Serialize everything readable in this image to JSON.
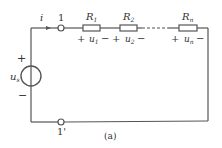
{
  "diagram": {
    "type": "series-resistor-circuit",
    "caption": "(a)",
    "current_label": "i",
    "terminals": [
      {
        "id": "1",
        "label": "1"
      },
      {
        "id": "1p",
        "label": "1'"
      }
    ],
    "source": {
      "symbol": "u",
      "subscript": "s",
      "plus": "+",
      "minus": "−"
    },
    "resistors": [
      {
        "name": "R",
        "sub": "1",
        "voltage": "u",
        "vsub": "1",
        "plus": "+",
        "minus": "−"
      },
      {
        "name": "R",
        "sub": "2",
        "voltage": "u",
        "vsub": "2",
        "plus": "+",
        "minus": "−"
      },
      {
        "name": "R",
        "sub": "n",
        "voltage": "u",
        "vsub": "n",
        "plus": "+",
        "minus": "−"
      }
    ],
    "colors": {
      "wire": "#555555",
      "text": "#333333",
      "background": "#ffffff"
    }
  }
}
